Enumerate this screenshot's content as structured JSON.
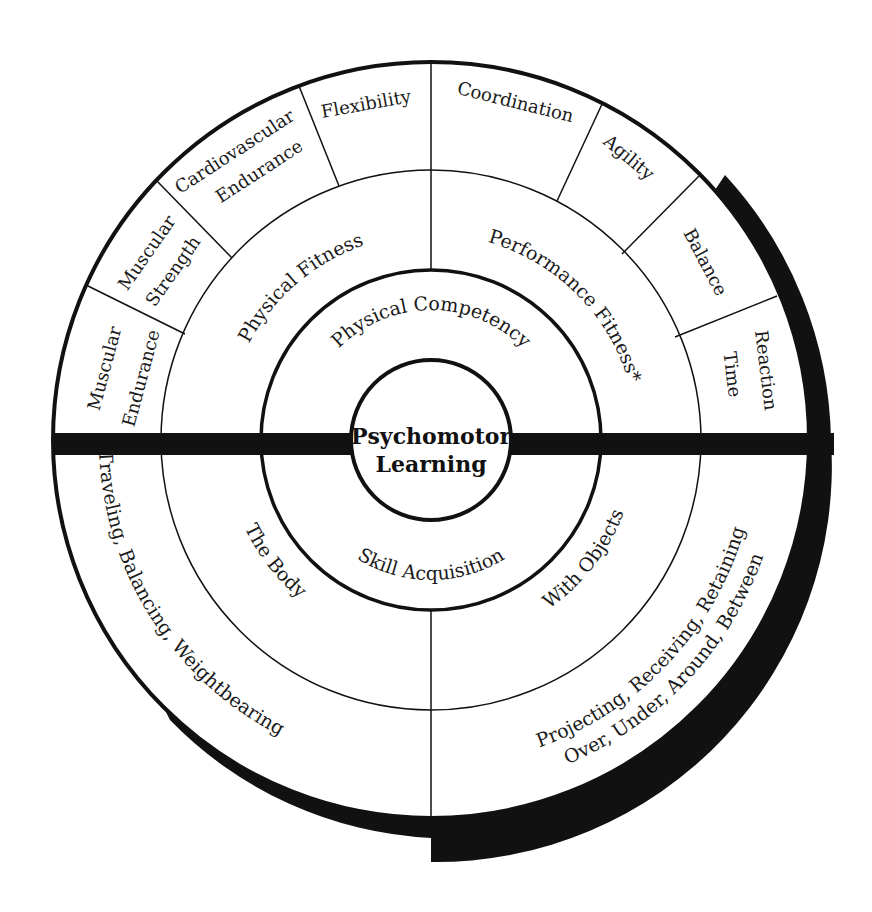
{
  "diagram": {
    "title": "Psychomotor Learning",
    "center": {
      "line1": "Psychomotor",
      "line2": "Learning"
    },
    "ring1": {
      "top": "Physical Competency",
      "bottom": "Skill Acquisition"
    },
    "ring2": {
      "top_left": "Physical Fitness",
      "top_right": "Performance Fitness*",
      "bottom_left": "The Body",
      "bottom_right": "With Objects"
    },
    "ring3": {
      "physical_fitness_components": [
        {
          "line1": "Muscular",
          "line2": "Endurance"
        },
        {
          "line1": "Muscular",
          "line2": "Strength"
        },
        {
          "line1": "Cardiovascular",
          "line2": "Endurance"
        },
        {
          "line1": "Flexibility",
          "line2": ""
        }
      ],
      "performance_fitness_components": [
        {
          "line1": "Coordination",
          "line2": ""
        },
        {
          "line1": "Agility",
          "line2": ""
        },
        {
          "line1": "Balance",
          "line2": ""
        },
        {
          "line1": "Reaction",
          "line2": "Time"
        }
      ],
      "body_skills": "Traveling, Balancing, Weightbearing",
      "object_skills": {
        "line1": "Projecting, Receiving, Retaining",
        "line2": "Over, Under, Around, Between"
      }
    },
    "colors": {
      "line": "#111111",
      "fill": "#ffffff",
      "shadow": "#111111"
    }
  }
}
